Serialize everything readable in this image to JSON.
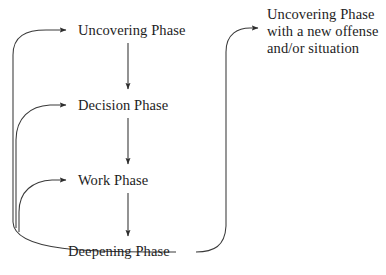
{
  "diagram": {
    "background_color": "#ffffff",
    "line_color": "#3a3a3a",
    "text_color": "#1d1d1d",
    "nodes": [
      {
        "id": "uncovering",
        "label": "Uncovering Phase"
      },
      {
        "id": "decision",
        "label": "Decision Phase"
      },
      {
        "id": "work",
        "label": "Work Phase"
      },
      {
        "id": "deepening",
        "label": "Deepening Phase"
      }
    ],
    "outcome": {
      "lines": [
        "Uncovering Phase",
        "with a new offense",
        "and/or situation"
      ]
    },
    "edges": [
      {
        "id": "uncovering-to-decision",
        "from": "uncovering",
        "to": "decision",
        "style": "straight-down-arrow"
      },
      {
        "id": "decision-to-work",
        "from": "decision",
        "to": "work",
        "style": "straight-down-arrow"
      },
      {
        "id": "work-to-deepening",
        "from": "work",
        "to": "deepening",
        "style": "straight-down-arrow"
      },
      {
        "id": "deepening-to-uncovering",
        "from": "deepening",
        "to": "uncovering",
        "style": "left-loop-back-arrow"
      },
      {
        "id": "deepening-to-decision",
        "from": "deepening",
        "to": "decision",
        "style": "left-loop-back-arrow"
      },
      {
        "id": "deepening-to-work",
        "from": "deepening",
        "to": "work",
        "style": "left-loop-back-arrow"
      },
      {
        "id": "deepening-to-outcome",
        "from": "deepening",
        "to": "outcome",
        "style": "right-loop-up-arrow"
      }
    ]
  }
}
